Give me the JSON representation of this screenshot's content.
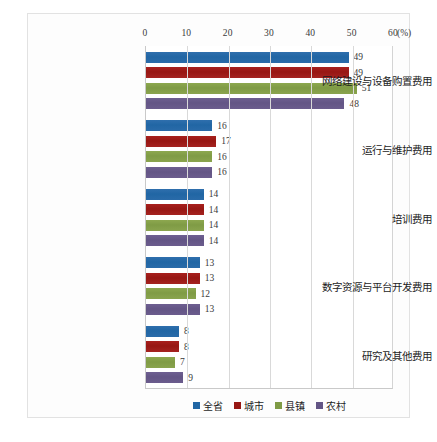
{
  "chart_data": {
    "type": "bar",
    "orientation": "horizontal",
    "title": "",
    "subtitle": "",
    "xlabel": "",
    "ylabel": "",
    "unit_label": "(%)",
    "xlim": [
      0,
      60
    ],
    "xticks": [
      0,
      10,
      20,
      30,
      40,
      50,
      60
    ],
    "xtick_labels": [
      "0",
      "10",
      "20",
      "30",
      "40",
      "50",
      "60"
    ],
    "grid": true,
    "legend_position": "bottom",
    "categories": [
      "网络建设与设备购置费用",
      "运行与维护费用",
      "培训费用",
      "数字资源与平台开发费用",
      "研究及其他费用"
    ],
    "series": [
      {
        "name": "全省",
        "color": "#2166a4",
        "values": [
          49,
          16,
          14,
          13,
          8
        ]
      },
      {
        "name": "城市",
        "color": "#971713",
        "values": [
          49,
          17,
          14,
          13,
          8
        ]
      },
      {
        "name": "县镇",
        "color": "#7f9b45",
        "values": [
          51,
          16,
          14,
          12,
          7
        ]
      },
      {
        "name": "农村",
        "color": "#635585",
        "values": [
          48,
          16,
          14,
          13,
          9
        ]
      }
    ]
  }
}
